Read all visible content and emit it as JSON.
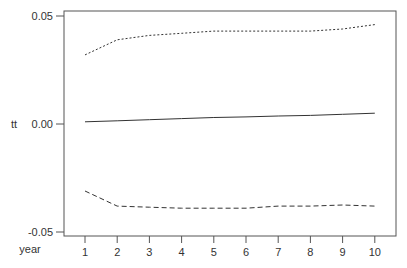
{
  "chart_data": {
    "type": "line",
    "title": "",
    "xlabel": "year",
    "ylabel": "tt",
    "x": [
      1,
      2,
      3,
      4,
      5,
      6,
      7,
      8,
      9,
      10
    ],
    "xticks": [
      "1",
      "2",
      "3",
      "4",
      "5",
      "6",
      "7",
      "8",
      "9",
      "10"
    ],
    "yticks": [
      "0.05",
      "0.00",
      "-0.05"
    ],
    "ytick_values": [
      0.05,
      0.0,
      -0.05
    ],
    "ylim": [
      -0.051,
      0.052
    ],
    "xlim": [
      0.35,
      10.65
    ],
    "grid": false,
    "legend": null,
    "series": [
      {
        "name": "upper bound",
        "style": "dotted",
        "values": [
          0.032,
          0.039,
          0.041,
          0.042,
          0.043,
          0.043,
          0.043,
          0.043,
          0.044,
          0.046
        ]
      },
      {
        "name": "estimate",
        "style": "solid",
        "values": [
          0.001,
          0.0015,
          0.002,
          0.0025,
          0.003,
          0.0033,
          0.0037,
          0.004,
          0.0045,
          0.005
        ]
      },
      {
        "name": "lower bound",
        "style": "dashed",
        "values": [
          -0.031,
          -0.038,
          -0.0385,
          -0.039,
          -0.039,
          -0.039,
          -0.038,
          -0.038,
          -0.0375,
          -0.038
        ]
      }
    ]
  },
  "colors": {
    "line": "#333333",
    "frame": "#555555",
    "text": "#333333"
  }
}
